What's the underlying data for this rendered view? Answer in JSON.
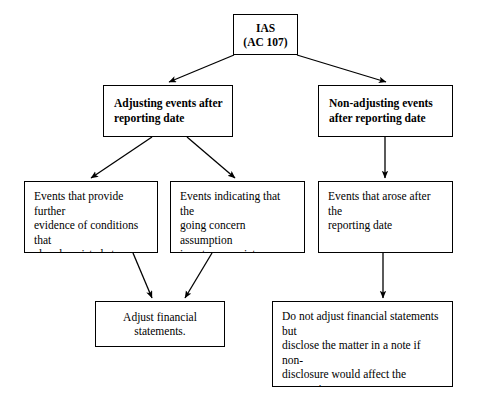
{
  "diagram": {
    "type": "flowchart",
    "background_color": "#ffffff",
    "line_color": "#000000",
    "box_fill": "#ffffff",
    "nodes": {
      "root": {
        "text": "IAS\n(AC 107)"
      },
      "adjusting": {
        "text": "Adjusting events after\nreporting date"
      },
      "non_adjusting": {
        "text": "Non-adjusting events\nafter reporting date"
      },
      "evidence": {
        "text": "Events that provide further\nevidence of conditions that\nalready existed at reporting\ndate"
      },
      "going_concern": {
        "text": "Events indicating that the\ngoing concern assumption\nis not appropriate"
      },
      "arose_after": {
        "text": "Events that arose after the\nreporting date"
      },
      "adjust_fs": {
        "text": "Adjust financial statements."
      },
      "disclose": {
        "text": "Do not adjust financial statements but\ndisclose the matter in a note if non-\ndisclosure would affect the economic\ndecisions of the users of the financial\nstatements."
      }
    },
    "edges": [
      {
        "from": "root",
        "to": "adjusting",
        "style": "diagonal-arrow"
      },
      {
        "from": "root",
        "to": "non_adjusting",
        "style": "diagonal-arrow"
      },
      {
        "from": "adjusting",
        "to": "evidence",
        "style": "diagonal-arrow"
      },
      {
        "from": "adjusting",
        "to": "going_concern",
        "style": "diagonal-arrow"
      },
      {
        "from": "non_adjusting",
        "to": "arose_after",
        "style": "vertical-arrow"
      },
      {
        "from": "evidence",
        "to": "adjust_fs",
        "style": "diagonal-arrow"
      },
      {
        "from": "going_concern",
        "to": "adjust_fs",
        "style": "diagonal-arrow"
      },
      {
        "from": "arose_after",
        "to": "disclose",
        "style": "vertical-arrow"
      }
    ]
  }
}
